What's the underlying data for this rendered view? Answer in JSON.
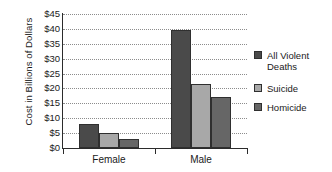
{
  "chart_data": {
    "type": "bar",
    "title": "",
    "xlabel": "",
    "ylabel": "Cost in Billions of Dollars",
    "categories": [
      "Female",
      "Male"
    ],
    "series": [
      {
        "name": "All Violent Deaths",
        "color": "#4a4a4a",
        "values": [
          8,
          39.5
        ]
      },
      {
        "name": "Suicide",
        "color": "#a8a8a8",
        "values": [
          5,
          21.5
        ]
      },
      {
        "name": "Homicide",
        "color": "#666666",
        "values": [
          3,
          17
        ]
      }
    ],
    "ylim": [
      0,
      45
    ],
    "ytick_step": 5,
    "ytick_labels": [
      "$0",
      "$5",
      "$10",
      "$15",
      "$20",
      "$25",
      "$30",
      "$35",
      "$40",
      "$45"
    ],
    "ytick_values": [
      0,
      5,
      10,
      15,
      20,
      25,
      30,
      35,
      40,
      45
    ],
    "grid": "horizontal-dotted",
    "legend_position": "right",
    "legend_entries": [
      {
        "label": "All Violent\nDeaths",
        "color": "#4a4a4a"
      },
      {
        "label": "Suicide",
        "color": "#a8a8a8"
      },
      {
        "label": "Homicide",
        "color": "#666666"
      }
    ]
  }
}
